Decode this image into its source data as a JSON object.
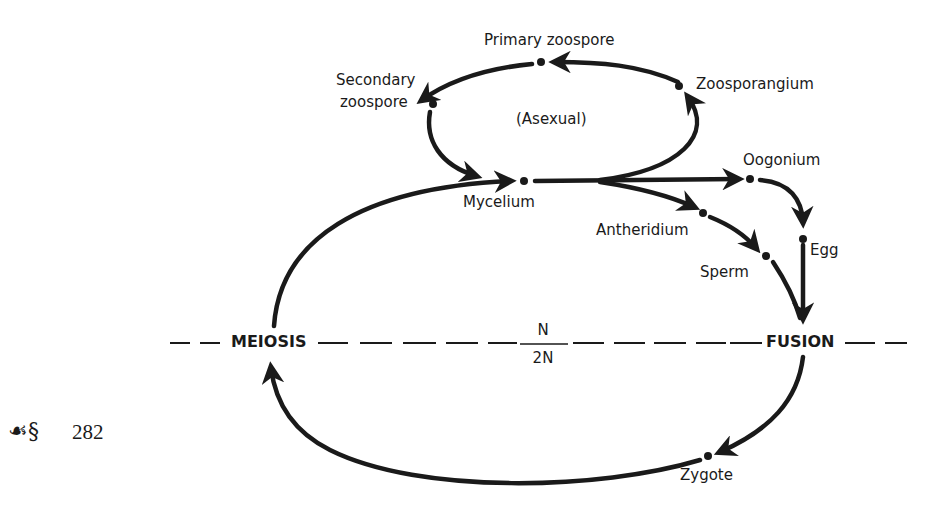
{
  "diagram": {
    "cycle_label": "(Asexual)",
    "nodes": {
      "primary_zoospore": "Primary zoospore",
      "secondary_zoospore_line1": "Secondary",
      "secondary_zoospore_line2": "zoospore",
      "zoosporangium": "Zoosporangium",
      "mycelium": "Mycelium",
      "oogonium": "Oogonium",
      "antheridium": "Antheridium",
      "egg": "Egg",
      "sperm": "Sperm",
      "fusion": "FUSION",
      "meiosis": "MEIOSIS",
      "zygote": "Zygote"
    },
    "ploidy": {
      "haploid": "N",
      "diploid": "2N"
    },
    "edges": [
      {
        "from": "Zoosporangium",
        "to": "Primary zoospore"
      },
      {
        "from": "Primary zoospore",
        "to": "Secondary zoospore"
      },
      {
        "from": "Secondary zoospore",
        "to": "Mycelium"
      },
      {
        "from": "Mycelium",
        "to": "Zoosporangium"
      },
      {
        "from": "Mycelium",
        "to": "Oogonium"
      },
      {
        "from": "Mycelium",
        "to": "Antheridium"
      },
      {
        "from": "Oogonium",
        "to": "Egg"
      },
      {
        "from": "Antheridium",
        "to": "Sperm"
      },
      {
        "from": "Egg",
        "to": "FUSION"
      },
      {
        "from": "Sperm",
        "to": "FUSION"
      },
      {
        "from": "FUSION",
        "to": "Zygote"
      },
      {
        "from": "Zygote",
        "to": "MEIOSIS"
      },
      {
        "from": "MEIOSIS",
        "to": "Mycelium"
      }
    ]
  },
  "page": {
    "ornament": "☙§",
    "number": "282"
  }
}
